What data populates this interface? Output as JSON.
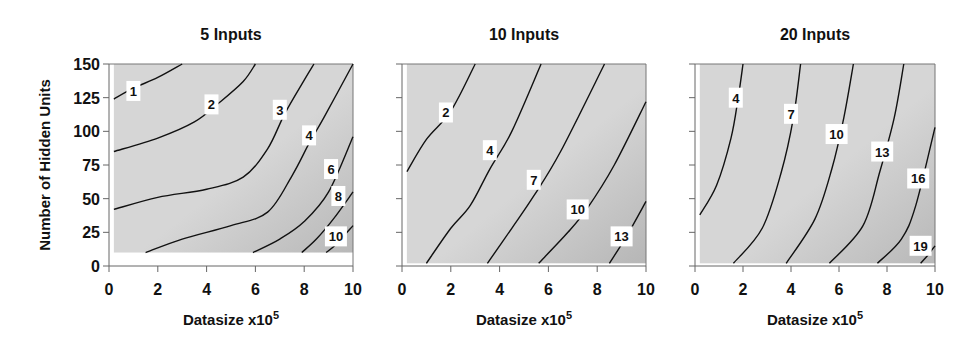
{
  "figure": {
    "ylabel": "Number of Hidden Units",
    "xlabel": "Datasize x10",
    "xlabel_superscript": "5"
  },
  "chart_data": [
    {
      "type": "contour",
      "title": "5 Inputs",
      "xlabel": "Datasize x10^5",
      "ylabel": "Number of Hidden Units",
      "xlim": [
        0,
        10
      ],
      "ylim": [
        0,
        150
      ],
      "xticks": [
        0,
        2,
        4,
        6,
        8,
        10
      ],
      "yticks": [
        0,
        25,
        50,
        75,
        100,
        125,
        150
      ],
      "data_region": {
        "x": [
          0.2,
          10
        ],
        "y": [
          10,
          150
        ]
      },
      "fill_light": "#d6d6d6",
      "fill_dark": "#b8b8b8",
      "contours": [
        {
          "level": "1",
          "points": [
            [
              0.2,
              124
            ],
            [
              1.0,
              132
            ],
            [
              2.0,
              140
            ],
            [
              3.0,
              150
            ]
          ],
          "label_at": [
            1.0,
            130
          ]
        },
        {
          "level": "2",
          "points": [
            [
              0.2,
              85
            ],
            [
              2.0,
              95
            ],
            [
              3.5,
              107
            ],
            [
              4.5,
              121
            ],
            [
              5.5,
              137
            ],
            [
              6.0,
              150
            ]
          ],
          "label_at": [
            4.2,
            120
          ]
        },
        {
          "level": "3",
          "points": [
            [
              0.2,
              42
            ],
            [
              2.0,
              51
            ],
            [
              4.0,
              57
            ],
            [
              5.5,
              66
            ],
            [
              6.5,
              87
            ],
            [
              7.2,
              113
            ],
            [
              8.0,
              138
            ],
            [
              8.4,
              150
            ]
          ],
          "label_at": [
            7.0,
            116
          ]
        },
        {
          "level": "4",
          "points": [
            [
              1.5,
              10
            ],
            [
              3.0,
              20
            ],
            [
              5.0,
              30
            ],
            [
              6.5,
              40
            ],
            [
              7.5,
              67
            ],
            [
              8.2,
              91
            ],
            [
              8.8,
              110
            ],
            [
              10,
              150
            ]
          ],
          "label_at": [
            8.2,
            97
          ]
        },
        {
          "level": "6",
          "points": [
            [
              5.9,
              10
            ],
            [
              7.0,
              20
            ],
            [
              8.0,
              33
            ],
            [
              9.0,
              55
            ],
            [
              10,
              96
            ]
          ],
          "label_at": [
            9.1,
            72
          ]
        },
        {
          "level": "8",
          "points": [
            [
              7.9,
              10
            ],
            [
              8.5,
              20
            ],
            [
              9.2,
              35
            ],
            [
              10,
              55
            ]
          ],
          "label_at": [
            9.4,
            52
          ]
        },
        {
          "level": "10",
          "points": [
            [
              8.9,
              10
            ],
            [
              9.3,
              16
            ],
            [
              10,
              30
            ]
          ],
          "label_at": [
            9.3,
            22
          ]
        }
      ]
    },
    {
      "type": "contour",
      "title": "10 Inputs",
      "xlabel": "Datasize x10^5",
      "xlim": [
        0,
        10
      ],
      "ylim": [
        0,
        150
      ],
      "xticks": [
        0,
        2,
        4,
        6,
        8,
        10
      ],
      "data_region": {
        "x": [
          0.2,
          10
        ],
        "y": [
          2,
          150
        ]
      },
      "fill_light": "#d6d6d6",
      "fill_dark": "#b6b6b6",
      "contours": [
        {
          "level": "2",
          "points": [
            [
              0.2,
              70
            ],
            [
              1.0,
              94
            ],
            [
              2.0,
              115
            ],
            [
              3.0,
              150
            ]
          ],
          "label_at": [
            1.8,
            114
          ]
        },
        {
          "level": "4",
          "points": [
            [
              1.0,
              2
            ],
            [
              2.0,
              28
            ],
            [
              2.8,
              45
            ],
            [
              3.6,
              72
            ],
            [
              4.5,
              100
            ],
            [
              5.7,
              150
            ]
          ],
          "label_at": [
            3.6,
            86
          ]
        },
        {
          "level": "7",
          "points": [
            [
              3.5,
              2
            ],
            [
              4.5,
              28
            ],
            [
              5.4,
              52
            ],
            [
              6.5,
              85
            ],
            [
              8.3,
              150
            ]
          ],
          "label_at": [
            5.4,
            64
          ]
        },
        {
          "level": "10",
          "points": [
            [
              5.6,
              2
            ],
            [
              6.8,
              25
            ],
            [
              7.6,
              43
            ],
            [
              8.7,
              75
            ],
            [
              10,
              122
            ]
          ],
          "label_at": [
            7.2,
            42
          ]
        },
        {
          "level": "13",
          "points": [
            [
              8.5,
              2
            ],
            [
              9.2,
              22
            ],
            [
              10,
              48
            ]
          ],
          "label_at": [
            9.0,
            22
          ]
        }
      ]
    },
    {
      "type": "contour",
      "title": "20 Inputs",
      "xlabel": "Datasize x10^5",
      "xlim": [
        0,
        10
      ],
      "ylim": [
        0,
        150
      ],
      "xticks": [
        0,
        2,
        4,
        6,
        8,
        10
      ],
      "data_region": {
        "x": [
          0.2,
          10
        ],
        "y": [
          2,
          150
        ]
      },
      "fill_light": "#d6d6d6",
      "fill_dark": "#b8b8b8",
      "contours": [
        {
          "level": "4",
          "points": [
            [
              0.2,
              38
            ],
            [
              0.9,
              60
            ],
            [
              1.5,
              95
            ],
            [
              1.8,
              125
            ],
            [
              2.0,
              150
            ]
          ],
          "label_at": [
            1.7,
            125
          ]
        },
        {
          "level": "7",
          "points": [
            [
              1.6,
              2
            ],
            [
              2.8,
              28
            ],
            [
              3.6,
              70
            ],
            [
              4.1,
              110
            ],
            [
              4.4,
              150
            ]
          ],
          "label_at": [
            4.0,
            113
          ]
        },
        {
          "level": "10",
          "points": [
            [
              3.8,
              2
            ],
            [
              5.0,
              35
            ],
            [
              5.7,
              72
            ],
            [
              6.2,
              110
            ],
            [
              6.6,
              150
            ]
          ],
          "label_at": [
            5.9,
            98
          ]
        },
        {
          "level": "13",
          "points": [
            [
              5.6,
              2
            ],
            [
              7.0,
              30
            ],
            [
              7.7,
              70
            ],
            [
              8.3,
              110
            ],
            [
              8.7,
              150
            ]
          ],
          "label_at": [
            7.8,
            85
          ]
        },
        {
          "level": "16",
          "points": [
            [
              7.6,
              2
            ],
            [
              8.6,
              20
            ],
            [
              9.2,
              45
            ],
            [
              10,
              103
            ]
          ],
          "label_at": [
            9.3,
            65
          ]
        },
        {
          "level": "19",
          "points": [
            [
              9.4,
              2
            ],
            [
              9.7,
              8
            ],
            [
              10,
              15
            ]
          ],
          "label_at": [
            9.4,
            15
          ]
        }
      ]
    }
  ],
  "panels_layout": [
    {
      "x0": 109,
      "x1": 353
    },
    {
      "x0": 402,
      "x1": 646
    },
    {
      "x0": 695,
      "x1": 935
    }
  ],
  "plot_y": {
    "y0": 266,
    "y1": 64
  }
}
